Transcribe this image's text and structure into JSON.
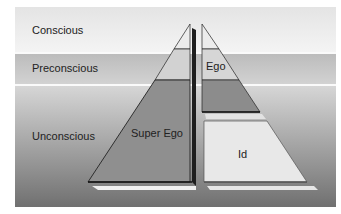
{
  "layers": {
    "conscious": "Conscious",
    "preconscious": "Preconscious",
    "unconscious": "Unconscious"
  },
  "pyramids": {
    "left": {
      "label": "Super Ego"
    },
    "right": {
      "top_label": "Ego",
      "bottom_label": "Id"
    }
  },
  "colors": {
    "light_fill": "#e6e6e6",
    "dark_fill": "#8a8a8a",
    "edge": "#222222"
  }
}
